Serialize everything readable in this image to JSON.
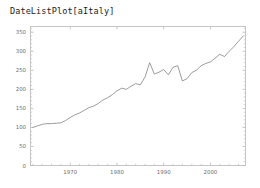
{
  "title": "DateListPlot[aItaly]",
  "colors": {
    "background": "#ffffff",
    "frame": "#b9b9b9",
    "line": "#8a8a8a",
    "tick_text": "#6e6e6e",
    "title_text": "#1a1a1a"
  },
  "chart_data": {
    "type": "line",
    "title": "DateListPlot[aItaly]",
    "xlabel": "",
    "ylabel": "",
    "xlim": [
      1961.5,
      2007.5
    ],
    "ylim": [
      0,
      365
    ],
    "grid": false,
    "legend": null,
    "xticks": [
      1970,
      1980,
      1990,
      2000
    ],
    "xtick_labels": [
      "1970",
      "1980",
      "1990",
      "2000"
    ],
    "yticks": [
      0,
      50,
      100,
      150,
      200,
      250,
      300,
      350
    ],
    "ytick_labels": [
      "0",
      "50",
      "100",
      "150",
      "200",
      "250",
      "300",
      "350"
    ],
    "x": [
      1962,
      1963,
      1964,
      1965,
      1966,
      1967,
      1968,
      1969,
      1970,
      1971,
      1972,
      1973,
      1974,
      1975,
      1976,
      1977,
      1978,
      1979,
      1980,
      1981,
      1982,
      1983,
      1984,
      1985,
      1986,
      1987,
      1988,
      1989,
      1990,
      1991,
      1992,
      1993,
      1994,
      1995,
      1996,
      1997,
      1998,
      1999,
      2000,
      2001,
      2002,
      2003,
      2004,
      2005,
      2006,
      2007
    ],
    "values": [
      100,
      104,
      108,
      110,
      110,
      111,
      112,
      118,
      126,
      133,
      138,
      145,
      152,
      156,
      163,
      172,
      178,
      186,
      196,
      203,
      200,
      208,
      215,
      212,
      232,
      270,
      240,
      245,
      252,
      238,
      258,
      262,
      222,
      228,
      244,
      250,
      262,
      268,
      272,
      282,
      292,
      286,
      300,
      312,
      326,
      340
    ]
  }
}
